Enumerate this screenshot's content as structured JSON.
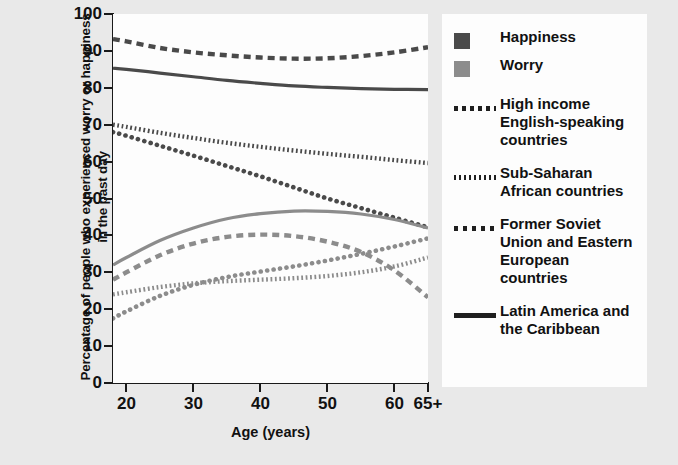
{
  "chart_data": {
    "type": "line",
    "title": "",
    "xlabel": "Age (years)",
    "ylabel": "Percentage of people who experienced worry or happiness in the past day",
    "xlim": [
      18,
      65
    ],
    "ylim": [
      0,
      100
    ],
    "grid": false,
    "legend_position": "right",
    "x": [
      18,
      20,
      25,
      30,
      35,
      40,
      45,
      50,
      55,
      60,
      65
    ],
    "xtick_labels": [
      "20",
      "30",
      "40",
      "50",
      "60",
      "65+"
    ],
    "xtick_values": [
      20,
      30,
      40,
      50,
      60,
      65
    ],
    "ytick_labels": [
      "0",
      "10",
      "20",
      "30",
      "40",
      "50",
      "60",
      "70",
      "80",
      "90",
      "100"
    ],
    "ytick_values": [
      0,
      10,
      20,
      30,
      40,
      50,
      60,
      70,
      80,
      90,
      100
    ],
    "measures": [
      {
        "name": "Happiness",
        "color": "#4a4a4a",
        "swatch": "sw-happy"
      },
      {
        "name": "Worry",
        "color": "#8c8c8c",
        "swatch": "sw-worry"
      }
    ],
    "regions": [
      {
        "name": "High income English-speaking countries",
        "style": "dashed",
        "key_class": "ln-dash"
      },
      {
        "name": "Sub-Saharan African countries",
        "style": "fine-dotted",
        "key_class": "ln-dot-fine"
      },
      {
        "name": "Former Soviet Union and Eastern European countries",
        "style": "round-dotted",
        "key_class": "ln-dot-round"
      },
      {
        "name": "Latin America and the Caribbean",
        "style": "solid",
        "key_class": "ln-solid"
      }
    ],
    "series": [
      {
        "name": "Happiness — High income English-speaking countries",
        "measure": "Happiness",
        "region": "High income English-speaking countries",
        "color": "#4a4a4a",
        "style": "dashed",
        "values": [
          93.2,
          92.6,
          90.8,
          89.6,
          88.8,
          88.2,
          87.9,
          88.0,
          88.6,
          89.6,
          91.0
        ]
      },
      {
        "name": "Happiness — Latin America and the Caribbean",
        "measure": "Happiness",
        "region": "Latin America and the Caribbean",
        "color": "#4a4a4a",
        "style": "solid",
        "values": [
          85.3,
          85.0,
          84.0,
          83.0,
          82.0,
          81.2,
          80.5,
          80.1,
          79.8,
          79.6,
          79.5
        ]
      },
      {
        "name": "Happiness — Sub-Saharan African countries",
        "measure": "Happiness",
        "region": "Sub-Saharan African countries",
        "color": "#4a4a4a",
        "style": "fine-dotted",
        "values": [
          70.0,
          69.4,
          67.8,
          66.4,
          65.1,
          64.0,
          63.0,
          62.1,
          61.3,
          60.4,
          59.6
        ]
      },
      {
        "name": "Happiness — Former Soviet Union and Eastern European countries",
        "measure": "Happiness",
        "region": "Former Soviet Union and Eastern European countries",
        "color": "#4a4a4a",
        "style": "round-dotted",
        "values": [
          68.0,
          67.0,
          64.3,
          61.6,
          58.8,
          56.0,
          53.0,
          50.0,
          47.4,
          44.8,
          42.2
        ]
      },
      {
        "name": "Worry — Latin America and the Caribbean",
        "measure": "Worry",
        "region": "Latin America and the Caribbean",
        "color": "#8c8c8c",
        "style": "solid",
        "values": [
          32.0,
          34.0,
          38.6,
          42.0,
          44.5,
          45.9,
          46.6,
          46.5,
          45.8,
          44.3,
          42.0
        ]
      },
      {
        "name": "Worry — High income English-speaking countries",
        "measure": "Worry",
        "region": "High income English-speaking countries",
        "color": "#8c8c8c",
        "style": "dashed",
        "values": [
          28.0,
          30.0,
          34.6,
          37.8,
          39.6,
          40.2,
          39.8,
          38.3,
          35.5,
          30.5,
          23.2
        ]
      },
      {
        "name": "Worry — Sub-Saharan African countries",
        "measure": "Worry",
        "region": "Sub-Saharan African countries",
        "color": "#8c8c8c",
        "style": "fine-dotted",
        "values": [
          24.0,
          24.6,
          26.0,
          27.0,
          27.6,
          28.0,
          28.4,
          29.0,
          30.0,
          31.6,
          34.0
        ]
      },
      {
        "name": "Worry — Former Soviet Union and Eastern European countries",
        "measure": "Worry",
        "region": "Former Soviet Union and Eastern European countries",
        "color": "#8c8c8c",
        "style": "round-dotted",
        "values": [
          17.5,
          19.4,
          23.6,
          26.6,
          28.7,
          30.2,
          31.6,
          33.2,
          35.0,
          37.0,
          39.2
        ]
      }
    ]
  },
  "legend": {
    "entries": [
      {
        "label": "Happiness",
        "kind": "swatch",
        "swatch": "sw-happy"
      },
      {
        "label": "Worry",
        "kind": "swatch",
        "swatch": "sw-worry"
      },
      {
        "label": "High income English-speaking countries",
        "kind": "line",
        "key_class": "ln-dash"
      },
      {
        "label": "Sub-Saharan African countries",
        "kind": "line",
        "key_class": "ln-dot-fine"
      },
      {
        "label": "Former Soviet Union and Eastern European countries",
        "kind": "line",
        "key_class": "ln-dot-round"
      },
      {
        "label": "Latin America and the Caribbean",
        "kind": "line",
        "key_class": "ln-solid"
      }
    ]
  }
}
